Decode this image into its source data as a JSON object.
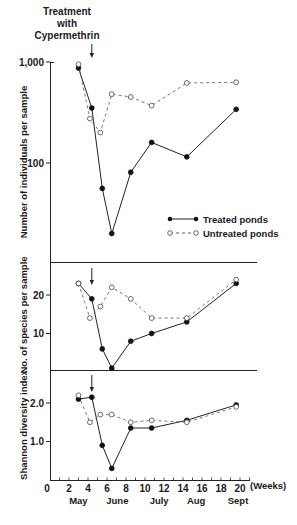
{
  "annotation": {
    "lines": [
      "Treatment",
      "with",
      "Cypermethrin"
    ],
    "arrow_week": 4.4
  },
  "legend": {
    "treated": "Treated ponds",
    "untreated": "Untreated ponds"
  },
  "x_axis": {
    "label": "(Weeks)",
    "ticks": [
      0,
      2,
      4,
      6,
      8,
      10,
      12,
      14,
      16,
      18,
      20
    ],
    "tick_labels": [
      "0",
      "2",
      "4",
      "6",
      "8",
      "10",
      "12",
      "14",
      "16",
      "18",
      "20"
    ],
    "months": [
      {
        "label": "May",
        "week": 3.2
      },
      {
        "label": "June",
        "week": 7.3
      },
      {
        "label": "July",
        "week": 11.7
      },
      {
        "label": "Aug",
        "week": 15.6
      },
      {
        "label": "Sept",
        "week": 20
      }
    ]
  },
  "chart_data": [
    {
      "type": "line",
      "title": "",
      "xlabel": "(Weeks)",
      "ylabel": "Number of individuals per sample",
      "yscale": "log",
      "ylim": [
        10,
        1000
      ],
      "ytick_labels": [
        "1,000",
        "100"
      ],
      "yticks": [
        1000,
        100
      ],
      "grid": false,
      "legend_position": "lower right",
      "series": [
        {
          "name": "Treated ponds",
          "style": "solid, filled circles",
          "x": [
            3.0,
            4.4,
            5.5,
            6.5,
            8.5,
            10.7,
            14.4,
            19.6
          ],
          "values": [
            870,
            350,
            56,
            20,
            81,
            160,
            115,
            340
          ]
        },
        {
          "name": "Untreated ponds",
          "style": "dashed, open circles",
          "x": [
            3.0,
            4.2,
            5.3,
            6.5,
            8.5,
            10.7,
            14.4,
            19.6
          ],
          "values": [
            950,
            275,
            200,
            480,
            450,
            370,
            620,
            630
          ]
        }
      ]
    },
    {
      "type": "line",
      "title": "",
      "xlabel": "(Weeks)",
      "ylabel": "No. of species per sample",
      "ylim": [
        0,
        28
      ],
      "yticks": [
        10,
        20
      ],
      "ytick_labels": [
        "10",
        "20"
      ],
      "grid": false,
      "series": [
        {
          "name": "Treated ponds",
          "x": [
            3.0,
            4.4,
            5.5,
            6.5,
            8.5,
            10.7,
            14.4,
            19.6
          ],
          "values": [
            23,
            19,
            6,
            1,
            8,
            10,
            13,
            23
          ]
        },
        {
          "name": "Untreated ponds",
          "x": [
            3.0,
            4.2,
            5.3,
            6.5,
            8.5,
            10.7,
            14.4,
            19.6
          ],
          "values": [
            23,
            14,
            17,
            22,
            19,
            14,
            14,
            24
          ]
        }
      ]
    },
    {
      "type": "line",
      "title": "",
      "xlabel": "(Weeks)",
      "ylabel": "Shannon diversity index",
      "ylim": [
        0,
        2.8
      ],
      "yticks": [
        1.0,
        2.0
      ],
      "ytick_labels": [
        "1.0",
        "2.0"
      ],
      "grid": false,
      "series": [
        {
          "name": "Treated ponds",
          "x": [
            3.0,
            4.4,
            5.5,
            6.5,
            8.5,
            10.7,
            14.4,
            19.6
          ],
          "values": [
            2.1,
            2.15,
            0.9,
            0.3,
            1.35,
            1.35,
            1.55,
            1.95
          ]
        },
        {
          "name": "Untreated ponds",
          "x": [
            3.0,
            4.2,
            5.3,
            6.5,
            8.5,
            10.7,
            14.4,
            19.6
          ],
          "values": [
            2.2,
            1.5,
            1.7,
            1.7,
            1.5,
            1.55,
            1.5,
            1.9
          ]
        }
      ]
    }
  ]
}
